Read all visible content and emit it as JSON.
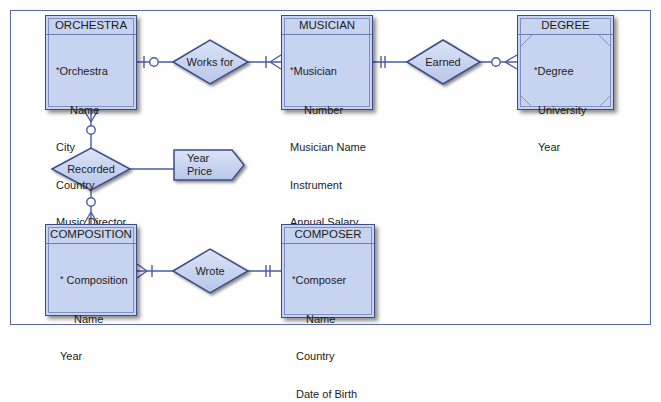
{
  "diagram": {
    "type": "entity-relationship",
    "colors": {
      "entity_fill": "#c7d4ef",
      "entity_border": "#3d4c86",
      "line": "#4a5aa8",
      "frame": "#5b68b0"
    },
    "entities": {
      "orchestra": {
        "name": "ORCHESTRA",
        "attributes": [
          {
            "text": "Orchestra",
            "pk": true
          },
          {
            "text": "Name",
            "indent": true
          },
          {
            "text": "City"
          },
          {
            "text": "Country"
          },
          {
            "text": "Music Director"
          }
        ]
      },
      "musician": {
        "name": "MUSICIAN",
        "attributes": [
          {
            "text": "Musician",
            "pk": true
          },
          {
            "text": "Number",
            "indent": true
          },
          {
            "text": "Musician Name"
          },
          {
            "text": "Instrument"
          },
          {
            "text": "Annual Salary"
          }
        ]
      },
      "degree": {
        "name": "DEGREE",
        "weak": true,
        "attributes": [
          {
            "text": "Degree",
            "pk": true
          },
          {
            "text": "University"
          },
          {
            "text": "Year"
          }
        ]
      },
      "composition": {
        "name": "COMPOSITION",
        "attributes": [
          {
            "text": "Composition",
            "pk": true
          },
          {
            "text": "Name",
            "indent": true
          },
          {
            "text": "Year"
          }
        ]
      },
      "composer": {
        "name": "COMPOSER",
        "attributes": [
          {
            "text": "Composer",
            "pk": true
          },
          {
            "text": "Name",
            "indent": true
          },
          {
            "text": "Country"
          },
          {
            "text": "Date of Birth"
          }
        ]
      }
    },
    "relationships": {
      "works_for": {
        "label": "Works for",
        "from": "ORCHESTRA",
        "to": "MUSICIAN",
        "from_cardinality": "zero-or-one",
        "to_cardinality": "one-or-many"
      },
      "earned": {
        "label": "Earned",
        "from": "MUSICIAN",
        "to": "DEGREE",
        "from_cardinality": "exactly-one",
        "to_cardinality": "zero-or-many"
      },
      "recorded": {
        "label": "Recorded",
        "from": "ORCHESTRA",
        "to": "COMPOSITION",
        "from_cardinality": "zero-or-many",
        "to_cardinality": "zero-or-many"
      },
      "wrote": {
        "label": "Wrote",
        "from": "COMPOSITION",
        "to": "COMPOSER",
        "from_cardinality": "one-or-many",
        "to_cardinality": "exactly-one"
      }
    },
    "relationship_attributes": {
      "recorded": {
        "lines": [
          "Year",
          "Price"
        ]
      }
    },
    "pk_marker": "*"
  }
}
